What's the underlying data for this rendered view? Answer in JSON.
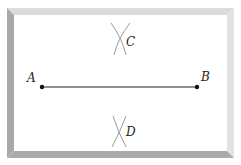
{
  "diagram": {
    "type": "geometric-construction",
    "points": [
      {
        "id": "A",
        "label": "A",
        "x": 42,
        "y": 87
      },
      {
        "id": "B",
        "label": "B",
        "x": 197,
        "y": 87
      }
    ],
    "segment": {
      "from": "A",
      "to": "B"
    },
    "arc_intersections": [
      {
        "id": "C",
        "label": "C",
        "x": 120,
        "y": 40
      },
      {
        "id": "D",
        "label": "D",
        "x": 120,
        "y": 130
      }
    ],
    "colors": {
      "frame_light": "#d9d9d9",
      "frame_dark": "#a8a8a8",
      "arc": "#9a9a9a",
      "segment": "#222222"
    }
  }
}
